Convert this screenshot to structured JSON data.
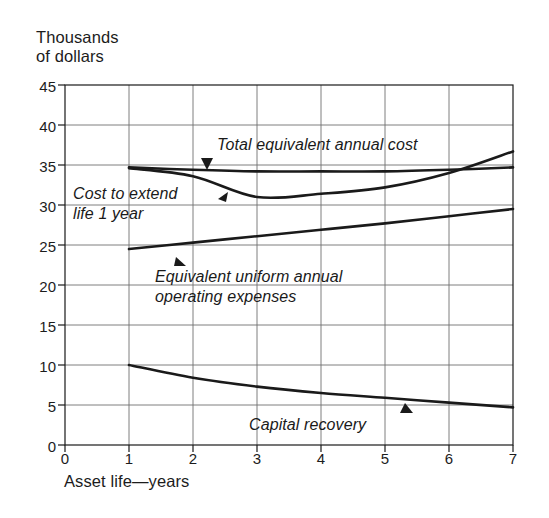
{
  "chart_data": {
    "type": "line",
    "title": "",
    "ylabel": "Thousands\nof dollars",
    "xlabel": "Asset life—years",
    "xlim": [
      0,
      7
    ],
    "ylim": [
      0,
      45
    ],
    "xticks": [
      "0",
      "1",
      "2",
      "3",
      "4",
      "5",
      "6",
      "7"
    ],
    "yticks": [
      "0",
      "5",
      "10",
      "15",
      "20",
      "25",
      "30",
      "35",
      "40",
      "45"
    ],
    "grid": true,
    "legend_position": "inline-annotations",
    "x": [
      1,
      2,
      3,
      4,
      5,
      6,
      7
    ],
    "series": [
      {
        "name": "Total equivalent annual cost",
        "values": [
          34.7,
          34.4,
          34.2,
          34.2,
          34.2,
          34.4,
          34.7
        ]
      },
      {
        "name": "Cost to extend life 1 year",
        "values": [
          34.6,
          33.6,
          31.0,
          31.4,
          32.2,
          34.0,
          36.7
        ]
      },
      {
        "name": "Equivalent uniform annual operating expenses",
        "values": [
          24.5,
          25.3,
          26.1,
          26.9,
          27.7,
          28.6,
          29.5
        ]
      },
      {
        "name": "Capital recovery",
        "values": [
          10.0,
          8.4,
          7.3,
          6.5,
          5.9,
          5.3,
          4.7
        ]
      }
    ],
    "annotations": [
      {
        "text": "Total equivalent annual cost",
        "marker": "down-arrow"
      },
      {
        "text": "Cost to extend\nlife 1 year",
        "marker": "right-arrow"
      },
      {
        "text": "Equivalent uniform annual\noperating expenses",
        "marker": "up-arrow"
      },
      {
        "text": "Capital recovery",
        "marker": "up-arrow"
      }
    ]
  },
  "axes": {
    "y_title": "Thousands\nof dollars",
    "x_title": "Asset life—years",
    "y_ticks": [
      "45",
      "40",
      "35",
      "30",
      "25",
      "20",
      "15",
      "10",
      "5",
      "0"
    ],
    "x_ticks": [
      "0",
      "1",
      "2",
      "3",
      "4",
      "5",
      "6",
      "7"
    ]
  },
  "labels": {
    "total_cost": "Total equivalent annual cost",
    "cost_extend_line1": "Cost to extend",
    "cost_extend_line2": "life 1 year",
    "operating_line1": "Equivalent uniform annual",
    "operating_line2": "operating expenses",
    "capital_recovery": "Capital recovery"
  },
  "colors": {
    "line": "#1a1a1a",
    "grid": "#6f6f6f",
    "axis": "#1a1a1a",
    "background": "#ffffff"
  }
}
